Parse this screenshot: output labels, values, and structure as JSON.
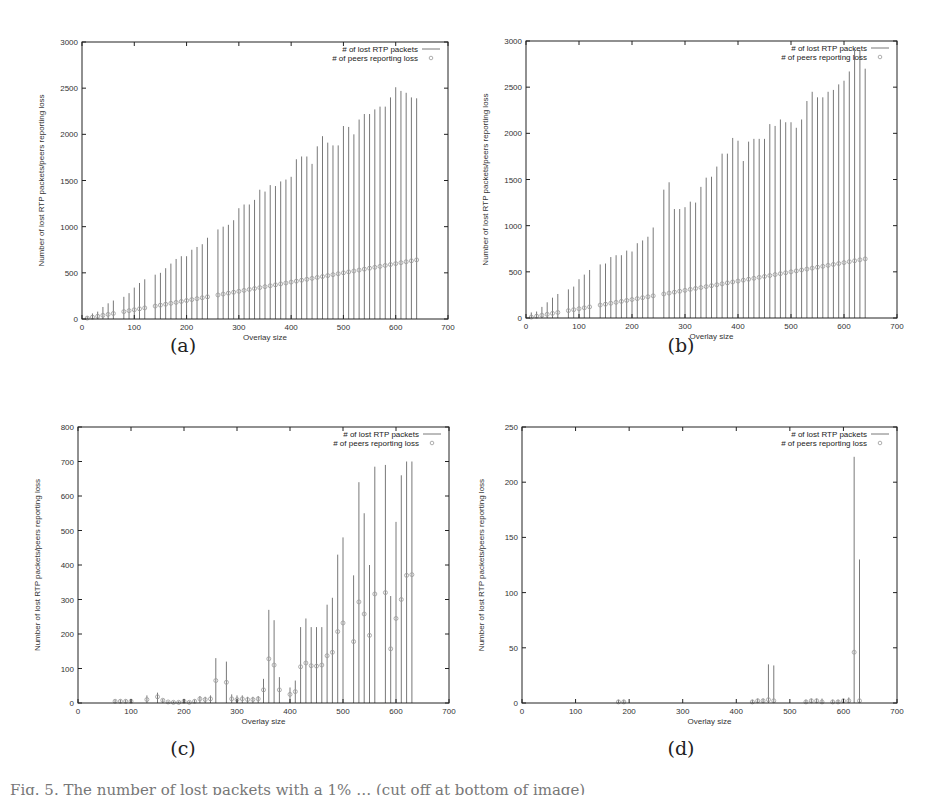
{
  "figure": {
    "caption_partial": "Fig. 5. The number of lost packets with a 1% … (cut off at bottom of image)",
    "legend": {
      "line_label": "# of lost RTP packets",
      "point_label": "# of peers reporting loss"
    },
    "xlabel": "Overlay size",
    "ylabel": "Number of lost RTP packets/peers reporting loss"
  },
  "chart_data": [
    {
      "id": "a",
      "panel_label": "(a)",
      "type": "scatter",
      "subtype": "errorbar",
      "xlabel": "Overlay size",
      "ylabel": "Number of lost RTP packets/peers reporting loss",
      "xlim": [
        0,
        700
      ],
      "ylim": [
        0,
        3000
      ],
      "xticks": [
        0,
        100,
        200,
        300,
        400,
        500,
        600,
        700
      ],
      "yticks": [
        0,
        500,
        1000,
        1500,
        2000,
        2500,
        3000
      ],
      "grid": false,
      "legend_position": "top-right",
      "series": [
        {
          "name": "# of lost RTP packets",
          "kind": "errorbar-top",
          "x": [
            10,
            20,
            30,
            40,
            50,
            60,
            80,
            90,
            100,
            110,
            120,
            140,
            150,
            160,
            170,
            180,
            190,
            200,
            210,
            220,
            230,
            240,
            260,
            270,
            280,
            290,
            300,
            310,
            320,
            330,
            340,
            350,
            360,
            370,
            380,
            390,
            400,
            410,
            420,
            430,
            440,
            450,
            460,
            470,
            480,
            490,
            500,
            510,
            520,
            530,
            540,
            550,
            560,
            570,
            580,
            590,
            600,
            610,
            620,
            630,
            640
          ],
          "values": [
            30,
            60,
            80,
            130,
            170,
            200,
            240,
            280,
            340,
            390,
            430,
            480,
            500,
            550,
            600,
            650,
            680,
            680,
            750,
            780,
            810,
            880,
            970,
            1000,
            1020,
            1070,
            1200,
            1240,
            1240,
            1290,
            1400,
            1380,
            1450,
            1440,
            1490,
            1510,
            1540,
            1730,
            1760,
            1760,
            1680,
            1870,
            1980,
            1910,
            1880,
            1880,
            2090,
            2080,
            2000,
            2160,
            2220,
            2220,
            2270,
            2300,
            2300,
            2400,
            2510,
            2470,
            2450,
            2400,
            2390
          ]
        },
        {
          "name": "# of peers reporting loss",
          "kind": "points",
          "x": [
            10,
            20,
            30,
            40,
            50,
            60,
            80,
            90,
            100,
            110,
            120,
            140,
            150,
            160,
            170,
            180,
            190,
            200,
            210,
            220,
            230,
            240,
            260,
            270,
            280,
            290,
            300,
            310,
            320,
            330,
            340,
            350,
            360,
            370,
            380,
            390,
            400,
            410,
            420,
            430,
            440,
            450,
            460,
            470,
            480,
            490,
            500,
            510,
            520,
            530,
            540,
            550,
            560,
            570,
            580,
            590,
            600,
            610,
            620,
            630,
            640
          ],
          "values": [
            10,
            20,
            30,
            40,
            50,
            60,
            80,
            90,
            100,
            110,
            120,
            140,
            150,
            160,
            170,
            180,
            190,
            200,
            210,
            220,
            230,
            240,
            260,
            270,
            280,
            290,
            300,
            310,
            320,
            330,
            340,
            350,
            360,
            370,
            380,
            390,
            400,
            410,
            420,
            430,
            440,
            450,
            460,
            470,
            480,
            490,
            500,
            510,
            520,
            530,
            540,
            550,
            560,
            570,
            580,
            590,
            600,
            610,
            620,
            630,
            640
          ]
        }
      ]
    },
    {
      "id": "b",
      "panel_label": "(b)",
      "type": "scatter",
      "subtype": "errorbar",
      "xlabel": "Overlay size",
      "ylabel": "Number of lost RTP packets/peers reporting loss",
      "xlim": [
        0,
        700
      ],
      "ylim": [
        0,
        3000
      ],
      "xticks": [
        0,
        100,
        200,
        300,
        400,
        500,
        600,
        700
      ],
      "yticks": [
        0,
        500,
        1000,
        1500,
        2000,
        2500,
        3000
      ],
      "grid": false,
      "legend_position": "top-right",
      "series": [
        {
          "name": "# of lost RTP packets",
          "kind": "errorbar-top",
          "x": [
            10,
            20,
            30,
            40,
            50,
            60,
            80,
            90,
            100,
            110,
            120,
            140,
            150,
            160,
            170,
            180,
            190,
            200,
            210,
            220,
            230,
            240,
            260,
            270,
            280,
            290,
            300,
            310,
            320,
            330,
            340,
            350,
            360,
            370,
            380,
            390,
            400,
            410,
            420,
            430,
            440,
            450,
            460,
            470,
            480,
            490,
            500,
            510,
            520,
            530,
            540,
            550,
            560,
            570,
            580,
            590,
            600,
            610,
            620,
            630,
            640
          ],
          "values": [
            60,
            70,
            120,
            170,
            220,
            260,
            310,
            340,
            420,
            470,
            520,
            580,
            590,
            660,
            680,
            680,
            730,
            720,
            810,
            840,
            880,
            980,
            1390,
            1470,
            1180,
            1180,
            1200,
            1260,
            1250,
            1420,
            1520,
            1530,
            1640,
            1780,
            1780,
            1950,
            1920,
            1700,
            1910,
            1940,
            1940,
            1940,
            2100,
            2080,
            2150,
            2120,
            2120,
            2060,
            2150,
            2350,
            2450,
            2390,
            2390,
            2450,
            2470,
            2530,
            2570,
            2670,
            2900,
            2900,
            2700
          ]
        },
        {
          "name": "# of peers reporting loss",
          "kind": "points",
          "x": [
            10,
            20,
            30,
            40,
            50,
            60,
            80,
            90,
            100,
            110,
            120,
            140,
            150,
            160,
            170,
            180,
            190,
            200,
            210,
            220,
            230,
            240,
            260,
            270,
            280,
            290,
            300,
            310,
            320,
            330,
            340,
            350,
            360,
            370,
            380,
            390,
            400,
            410,
            420,
            430,
            440,
            450,
            460,
            470,
            480,
            490,
            500,
            510,
            520,
            530,
            540,
            550,
            560,
            570,
            580,
            590,
            600,
            610,
            620,
            630,
            640
          ],
          "values": [
            10,
            20,
            30,
            40,
            50,
            60,
            80,
            90,
            100,
            110,
            120,
            140,
            150,
            160,
            170,
            180,
            190,
            200,
            210,
            220,
            230,
            240,
            260,
            270,
            280,
            290,
            300,
            310,
            320,
            330,
            340,
            350,
            360,
            370,
            380,
            390,
            400,
            410,
            420,
            430,
            440,
            450,
            460,
            470,
            480,
            490,
            500,
            510,
            520,
            530,
            540,
            550,
            560,
            570,
            580,
            590,
            600,
            610,
            620,
            630,
            640
          ]
        }
      ]
    },
    {
      "id": "c",
      "panel_label": "(c)",
      "type": "scatter",
      "subtype": "errorbar",
      "xlabel": "Overlay size",
      "ylabel": "Number of lost RTP packets/peers reporting loss",
      "xlim": [
        0,
        700
      ],
      "ylim": [
        0,
        800
      ],
      "xticks": [
        0,
        100,
        200,
        300,
        400,
        500,
        600,
        700
      ],
      "yticks": [
        0,
        100,
        200,
        300,
        400,
        500,
        600,
        700,
        800
      ],
      "grid": false,
      "legend_position": "top-right",
      "series": [
        {
          "name": "# of lost RTP packets",
          "kind": "errorbar-top",
          "x": [
            70,
            80,
            90,
            100,
            130,
            150,
            160,
            170,
            180,
            190,
            200,
            210,
            220,
            230,
            240,
            250,
            260,
            280,
            290,
            300,
            310,
            320,
            330,
            340,
            350,
            360,
            370,
            380,
            400,
            410,
            420,
            430,
            440,
            450,
            460,
            470,
            480,
            490,
            500,
            520,
            530,
            540,
            550,
            560,
            580,
            590,
            600,
            610,
            620,
            630
          ],
          "values": [
            10,
            10,
            10,
            12,
            22,
            30,
            12,
            5,
            5,
            5,
            12,
            5,
            10,
            20,
            18,
            22,
            130,
            120,
            25,
            22,
            22,
            18,
            18,
            20,
            70,
            270,
            240,
            75,
            45,
            65,
            220,
            245,
            220,
            220,
            220,
            285,
            305,
            430,
            480,
            370,
            640,
            550,
            400,
            685,
            690,
            310,
            525,
            660,
            700,
            700
          ]
        },
        {
          "name": "# of peers reporting loss",
          "kind": "points",
          "x": [
            70,
            80,
            90,
            100,
            130,
            150,
            160,
            170,
            180,
            190,
            200,
            210,
            220,
            230,
            240,
            250,
            260,
            280,
            290,
            300,
            310,
            320,
            330,
            340,
            350,
            360,
            370,
            380,
            400,
            410,
            420,
            430,
            440,
            450,
            460,
            470,
            480,
            490,
            500,
            520,
            530,
            540,
            550,
            560,
            580,
            590,
            600,
            610,
            620,
            630
          ],
          "values": [
            5,
            5,
            5,
            5,
            10,
            18,
            8,
            3,
            2,
            2,
            5,
            2,
            5,
            12,
            10,
            12,
            65,
            60,
            12,
            10,
            12,
            10,
            10,
            12,
            38,
            128,
            110,
            38,
            25,
            33,
            105,
            116,
            108,
            107,
            110,
            137,
            147,
            207,
            232,
            178,
            293,
            258,
            196,
            316,
            320,
            157,
            245,
            300,
            370,
            372
          ]
        }
      ]
    },
    {
      "id": "d",
      "panel_label": "(d)",
      "type": "scatter",
      "subtype": "errorbar",
      "xlabel": "Overlay size",
      "ylabel": "Number of lost RTP packets/peers reporting loss",
      "xlim": [
        0,
        700
      ],
      "ylim": [
        0,
        250
      ],
      "xticks": [
        0,
        100,
        200,
        300,
        400,
        500,
        600,
        700
      ],
      "yticks": [
        0,
        50,
        100,
        150,
        200,
        250
      ],
      "grid": false,
      "legend_position": "top-right",
      "series": [
        {
          "name": "# of lost RTP packets",
          "kind": "errorbar-top",
          "x": [
            180,
            190,
            430,
            440,
            450,
            460,
            470,
            530,
            540,
            550,
            560,
            580,
            590,
            600,
            610,
            620,
            630
          ],
          "values": [
            3,
            3,
            3,
            4,
            4,
            35,
            34,
            3,
            4,
            4,
            4,
            3,
            3,
            4,
            5,
            223,
            130
          ]
        },
        {
          "name": "# of peers reporting loss",
          "kind": "points",
          "x": [
            180,
            190,
            430,
            440,
            450,
            460,
            470,
            530,
            540,
            550,
            560,
            580,
            590,
            600,
            610,
            620,
            630
          ],
          "values": [
            1,
            1,
            1,
            2,
            2,
            3,
            2,
            1,
            2,
            2,
            1,
            1,
            1,
            2,
            2,
            46,
            2
          ]
        }
      ]
    }
  ],
  "layout": {
    "panels": [
      {
        "id": "a",
        "left": 82,
        "top": 42,
        "right": 448,
        "bottom": 319,
        "caption_x": 183,
        "caption_y": 338
      },
      {
        "id": "b",
        "left": 526,
        "top": 41,
        "right": 897,
        "bottom": 318,
        "caption_x": 681,
        "caption_y": 338
      },
      {
        "id": "c",
        "left": 78,
        "top": 427,
        "right": 449,
        "bottom": 703,
        "caption_x": 183,
        "caption_y": 741
      },
      {
        "id": "d",
        "left": 522,
        "top": 427,
        "right": 897,
        "bottom": 703,
        "caption_x": 681,
        "caption_y": 741
      }
    ],
    "colors": {
      "axis": "#222222",
      "errorbar": "#555555",
      "point": "#999999",
      "text": "#333333"
    }
  }
}
